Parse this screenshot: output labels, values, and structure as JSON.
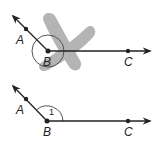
{
  "figures": [
    {
      "id": "top",
      "description": "Angle ABC with reflex arc crossed out",
      "labels": {
        "a": "A",
        "b": "B",
        "c": "C"
      },
      "crossed_out": true
    },
    {
      "id": "bottom",
      "description": "Angle ABC with angle 1 marked",
      "labels": {
        "a": "A",
        "b": "B",
        "c": "C",
        "angle": "1"
      },
      "crossed_out": false
    }
  ],
  "colors": {
    "line": "#222222",
    "cross_mark": "#a6a6a6",
    "arc": "#555555"
  }
}
